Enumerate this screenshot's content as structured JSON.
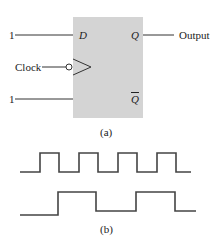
{
  "figure_a": {
    "caption": "(a)",
    "flipflop": {
      "inputs": {
        "d_label": "D",
        "d_value": "1",
        "clock_label": "Clock",
        "bottom_value": "1"
      },
      "outputs": {
        "q_label": "Q",
        "qbar_label": "Q",
        "q_output_label": "Output"
      },
      "box_color": "#d4d4d4",
      "clock_inverted": true
    }
  },
  "figure_b": {
    "caption": "(b)",
    "waveforms": [
      {
        "name": "clock",
        "transitions_x": [
          40,
          59,
          79,
          98,
          118,
          137,
          157,
          176
        ],
        "start_level": "low"
      },
      {
        "name": "output",
        "transitions_x": [
          58,
          96,
          136,
          175
        ],
        "start_level": "low"
      }
    ]
  }
}
